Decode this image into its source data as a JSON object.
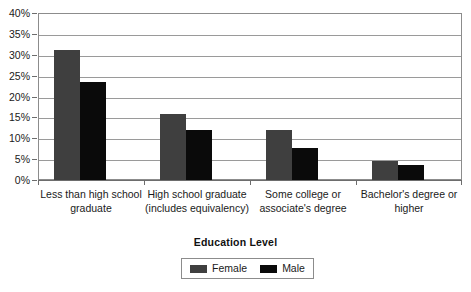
{
  "chart_data": {
    "type": "bar",
    "title": "",
    "xlabel": "Education Level",
    "ylabel": "",
    "categories": [
      "Less than high school graduate",
      "High school graduate (includes equivalency)",
      "Some college or associate's degree",
      "Bachelor's degree or higher"
    ],
    "series": [
      {
        "name": "Female",
        "color": "#3f3f3f",
        "values": [
          31.2,
          15.7,
          12.0,
          4.5
        ]
      },
      {
        "name": "Male",
        "color": "#0a0a0a",
        "values": [
          23.5,
          11.9,
          7.7,
          3.6
        ]
      }
    ],
    "ylim": [
      0,
      40
    ],
    "y_ticks": [
      "0%",
      "5%",
      "10%",
      "15%",
      "20%",
      "25%",
      "30%",
      "35%",
      "40%"
    ],
    "y_tick_values": [
      0,
      5,
      10,
      15,
      20,
      25,
      30,
      35,
      40
    ],
    "grid": true,
    "legend_position": "bottom"
  },
  "axis": {
    "x_title": "Education Level"
  },
  "legend": {
    "items": [
      {
        "label": "Female"
      },
      {
        "label": "Male"
      }
    ]
  },
  "colors": {
    "female": "#3f3f3f",
    "male": "#0a0a0a",
    "gridline": "#9a9a9a",
    "frame": "#8c8c8c"
  }
}
